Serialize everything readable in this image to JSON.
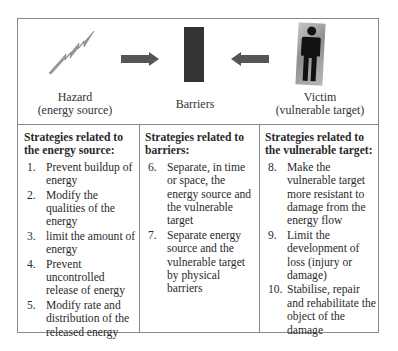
{
  "diagram": {
    "top": {
      "hazard": {
        "icon": "lightning-bolt-icon",
        "label_line1": "Hazard",
        "label_line2": "(energy source)"
      },
      "arrow_left_to_barrier": "arrow-right-icon",
      "barrier": {
        "icon": "barrier-block-icon",
        "label": "Barriers"
      },
      "arrow_right_to_barrier": "arrow-left-icon",
      "victim": {
        "icon": "person-icon",
        "label_line1": "Victim",
        "label_line2": "(vulnerable target)"
      }
    },
    "columns": [
      {
        "title": "Strategies related to the energy source:",
        "items": [
          {
            "num": "1.",
            "text": "Prevent buildup of energy"
          },
          {
            "num": "2.",
            "text": "Modify the qualities of the energy"
          },
          {
            "num": "3.",
            "text": "limit the amount of energy"
          },
          {
            "num": "4.",
            "text": "Prevent uncontrolled release of energy"
          },
          {
            "num": "5.",
            "text": "Modify rate and distribution of the released energy"
          }
        ]
      },
      {
        "title": "Strategies related to barriers:",
        "items": [
          {
            "num": "6.",
            "text": "Separate, in time or space, the energy source and the vulnerable target"
          },
          {
            "num": "7.",
            "text": "Separate energy source and the vulnerable target by physical barriers"
          }
        ]
      },
      {
        "title": "Strategies related to the vulnerable target:",
        "items": [
          {
            "num": "8.",
            "text": "Make the vulnerable target more resistant to damage from the energy flow"
          },
          {
            "num": "9.",
            "text": "Limit the development of loss (injury or damage)"
          },
          {
            "num": "10.",
            "text": "Stabilise, repair and rehabilitate the object of the damage"
          }
        ]
      }
    ],
    "colors": {
      "border": "#8a8a8a",
      "arrow": "#555555",
      "barrier": "#333333",
      "text": "#2a2a2a"
    }
  }
}
